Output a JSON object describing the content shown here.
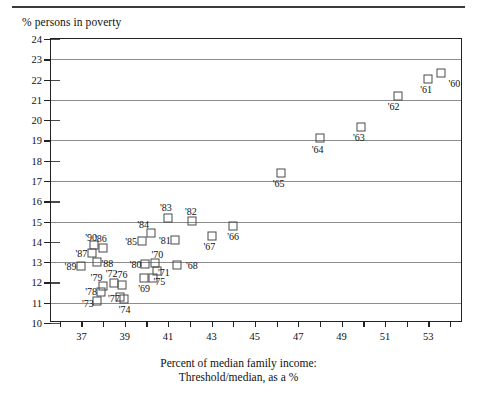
{
  "figure": {
    "top_rule": true,
    "ylabel_top": "% persons in poverty",
    "xlabel_line1": "Percent of median family income:",
    "xlabel_line2": "Threshold/median, as a %"
  },
  "chart_data": {
    "type": "scatter",
    "title": "",
    "xlabel": "Percent of median family income: Threshold/median, as a %",
    "ylabel": "% persons in poverty",
    "xlim": [
      35.6,
      54.6
    ],
    "ylim": [
      10,
      24
    ],
    "xticks": [
      36,
      37,
      38,
      39,
      40,
      41,
      42,
      43,
      44,
      45,
      46,
      47,
      48,
      49,
      50,
      51,
      52,
      53,
      54
    ],
    "xtick_labels": [
      "",
      "37",
      "",
      "39",
      "",
      "41",
      "",
      "43",
      "",
      "45",
      "",
      "47",
      "",
      "49",
      "",
      "51",
      "",
      "53",
      ""
    ],
    "yticks": [
      10,
      11,
      12,
      13,
      14,
      15,
      16,
      17,
      18,
      19,
      20,
      21,
      22,
      23,
      24
    ],
    "ytick_labels": [
      "10",
      "11",
      "12",
      "13",
      "14",
      "15",
      "16",
      "17",
      "18",
      "19",
      "20",
      "21",
      "22",
      "23",
      "24"
    ],
    "gridlines_y": [
      11,
      13,
      15,
      17,
      19,
      21,
      23
    ],
    "grid": "horizontal-odd",
    "legend": "none",
    "marker": "open-square",
    "points": [
      {
        "label": "'60",
        "x": 53.6,
        "y": 22.35,
        "lx": 54.2,
        "ly": 21.85
      },
      {
        "label": "'61",
        "x": 53.0,
        "y": 22.05,
        "lx": 52.9,
        "ly": 21.55
      },
      {
        "label": "'62",
        "x": 51.6,
        "y": 21.2,
        "lx": 51.4,
        "ly": 20.7
      },
      {
        "label": "'63",
        "x": 49.9,
        "y": 19.65,
        "lx": 49.8,
        "ly": 19.15
      },
      {
        "label": "'64",
        "x": 48.0,
        "y": 19.1,
        "lx": 47.9,
        "ly": 18.6
      },
      {
        "label": "'65",
        "x": 46.2,
        "y": 17.4,
        "lx": 46.1,
        "ly": 16.9
      },
      {
        "label": "'66",
        "x": 44.0,
        "y": 14.8,
        "lx": 44.0,
        "ly": 14.3
      },
      {
        "label": "'67",
        "x": 43.0,
        "y": 14.3,
        "lx": 42.9,
        "ly": 13.8
      },
      {
        "label": "'68",
        "x": 41.4,
        "y": 12.85,
        "lx": 42.1,
        "ly": 12.85
      },
      {
        "label": "'69",
        "x": 39.9,
        "y": 12.2,
        "lx": 39.9,
        "ly": 11.75
      },
      {
        "label": "'70",
        "x": 40.4,
        "y": 12.95,
        "lx": 40.5,
        "ly": 13.4
      },
      {
        "label": "'71",
        "x": 40.5,
        "y": 12.55,
        "lx": 40.8,
        "ly": 12.5
      },
      {
        "label": "'72",
        "x": 38.5,
        "y": 11.95,
        "lx": 38.4,
        "ly": 12.45
      },
      {
        "label": "'73",
        "x": 37.7,
        "y": 11.1,
        "lx": 37.3,
        "ly": 11.0
      },
      {
        "label": "'74",
        "x": 38.95,
        "y": 11.2,
        "lx": 39.0,
        "ly": 10.7
      },
      {
        "label": "'75",
        "x": 40.3,
        "y": 12.2,
        "lx": 40.6,
        "ly": 12.05
      },
      {
        "label": "'76",
        "x": 38.85,
        "y": 11.9,
        "lx": 38.85,
        "ly": 12.4
      },
      {
        "label": "'77",
        "x": 38.8,
        "y": 11.3,
        "lx": 38.5,
        "ly": 11.25
      },
      {
        "label": "'78",
        "x": 37.9,
        "y": 11.55,
        "lx": 37.45,
        "ly": 11.6
      },
      {
        "label": "'79",
        "x": 38.0,
        "y": 11.85,
        "lx": 37.7,
        "ly": 12.25
      },
      {
        "label": "'80",
        "x": 39.95,
        "y": 12.9,
        "lx": 39.5,
        "ly": 12.9
      },
      {
        "label": "'81",
        "x": 41.3,
        "y": 14.1,
        "lx": 40.85,
        "ly": 14.1
      },
      {
        "label": "'82",
        "x": 42.1,
        "y": 15.05,
        "lx": 42.05,
        "ly": 15.5
      },
      {
        "label": "'83",
        "x": 41.0,
        "y": 15.2,
        "lx": 40.9,
        "ly": 15.7
      },
      {
        "label": "'84",
        "x": 40.2,
        "y": 14.45,
        "lx": 39.85,
        "ly": 14.9
      },
      {
        "label": "'85",
        "x": 39.8,
        "y": 14.05,
        "lx": 39.3,
        "ly": 14.05
      },
      {
        "label": "'86",
        "x": 38.0,
        "y": 13.7,
        "lx": 37.9,
        "ly": 14.2
      },
      {
        "label": "'87",
        "x": 37.5,
        "y": 13.45,
        "lx": 37.0,
        "ly": 13.45
      },
      {
        "label": "'88",
        "x": 37.7,
        "y": 13.0,
        "lx": 38.2,
        "ly": 12.95
      },
      {
        "label": "'89",
        "x": 37.0,
        "y": 12.8,
        "lx": 36.5,
        "ly": 12.8
      },
      {
        "label": "'90",
        "x": 37.6,
        "y": 13.85,
        "lx": 37.45,
        "ly": 14.25
      }
    ]
  }
}
